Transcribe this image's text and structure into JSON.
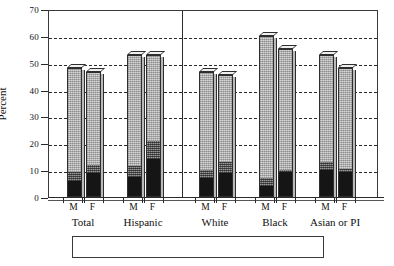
{
  "chart_data": {
    "type": "bar",
    "subtype": "stacked-bar-3d",
    "title": "",
    "xlabel": "",
    "ylabel": "Percent",
    "ylim": [
      0,
      70
    ],
    "ytick_step": 10,
    "yticks": [
      0,
      10,
      20,
      30,
      40,
      50,
      60,
      70
    ],
    "grid": "horizontal-dashed",
    "legend_position": "bottom",
    "group_separator_after": "Hispanic",
    "categories": [
      "Total M",
      "Total F",
      "Hispanic M",
      "Hispanic F",
      "White M",
      "White F",
      "Black M",
      "Black F",
      "Asian or PI M",
      "Asian or PI F"
    ],
    "groups": [
      {
        "label": "Total",
        "sexes": [
          "M",
          "F"
        ]
      },
      {
        "label": "Hispanic",
        "sexes": [
          "M",
          "F"
        ]
      },
      {
        "label": "White",
        "sexes": [
          "M",
          "F"
        ]
      },
      {
        "label": "Black",
        "sexes": [
          "M",
          "F"
        ]
      },
      {
        "label": "Asian or PI",
        "sexes": [
          "M",
          "F"
        ]
      }
    ],
    "series": [
      {
        "name": "Quit 3+ months",
        "color": "#151515",
        "values": [
          6,
          9,
          7.5,
          14,
          7,
          9,
          4,
          9.5,
          10,
          9.5
        ]
      },
      {
        "name": "Quit <3 months",
        "color": "#6d6d6d",
        "values": [
          3.5,
          3,
          4,
          7,
          3,
          4,
          3,
          0.5,
          3,
          1
        ]
      },
      {
        "name": "Relapsed",
        "color": "#d7d7d7",
        "values": [
          38.5,
          34.5,
          41.5,
          32,
          36.5,
          32.5,
          53,
          45,
          40,
          37.5
        ]
      }
    ],
    "totals": [
      48,
      46.5,
      53,
      53,
      46.5,
      45.5,
      60,
      55,
      53,
      48
    ]
  },
  "legend": {
    "items": [
      {
        "label": "Quit 3+ months",
        "swatch": "quit3plus-swatch"
      },
      {
        "label": "Quit <3 months",
        "swatch": "quitlt3-swatch"
      },
      {
        "label": "Relapsed",
        "swatch": "relapsed-swatch"
      }
    ]
  }
}
